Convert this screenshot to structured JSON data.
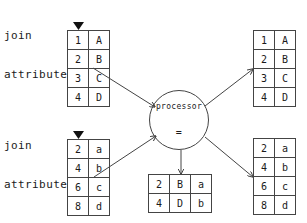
{
  "labels": {
    "join_top_line1": "join",
    "join_top_line2": "attribute",
    "join_bottom_line1": "join",
    "join_bottom_line2": "attribute"
  },
  "processor": {
    "title": "processor",
    "operator": "="
  },
  "tables": {
    "input_left_top": {
      "rows": [
        [
          "1",
          "A"
        ],
        [
          "2",
          "B"
        ],
        [
          "3",
          "C"
        ],
        [
          "4",
          "D"
        ]
      ]
    },
    "input_left_bottom": {
      "rows": [
        [
          "2",
          "a"
        ],
        [
          "4",
          "b"
        ],
        [
          "6",
          "c"
        ],
        [
          "8",
          "d"
        ]
      ]
    },
    "output_right_top": {
      "rows": [
        [
          "1",
          "A"
        ],
        [
          "2",
          "B"
        ],
        [
          "3",
          "C"
        ],
        [
          "4",
          "D"
        ]
      ]
    },
    "output_right_bottom": {
      "rows": [
        [
          "2",
          "a"
        ],
        [
          "4",
          "b"
        ],
        [
          "6",
          "c"
        ],
        [
          "8",
          "d"
        ]
      ]
    },
    "join_result": {
      "rows": [
        [
          "2",
          "B",
          "a"
        ],
        [
          "4",
          "D",
          "b"
        ]
      ]
    }
  },
  "colors": {
    "line": "#444444",
    "text": "#1a1a1a",
    "background": "#ffffff"
  }
}
